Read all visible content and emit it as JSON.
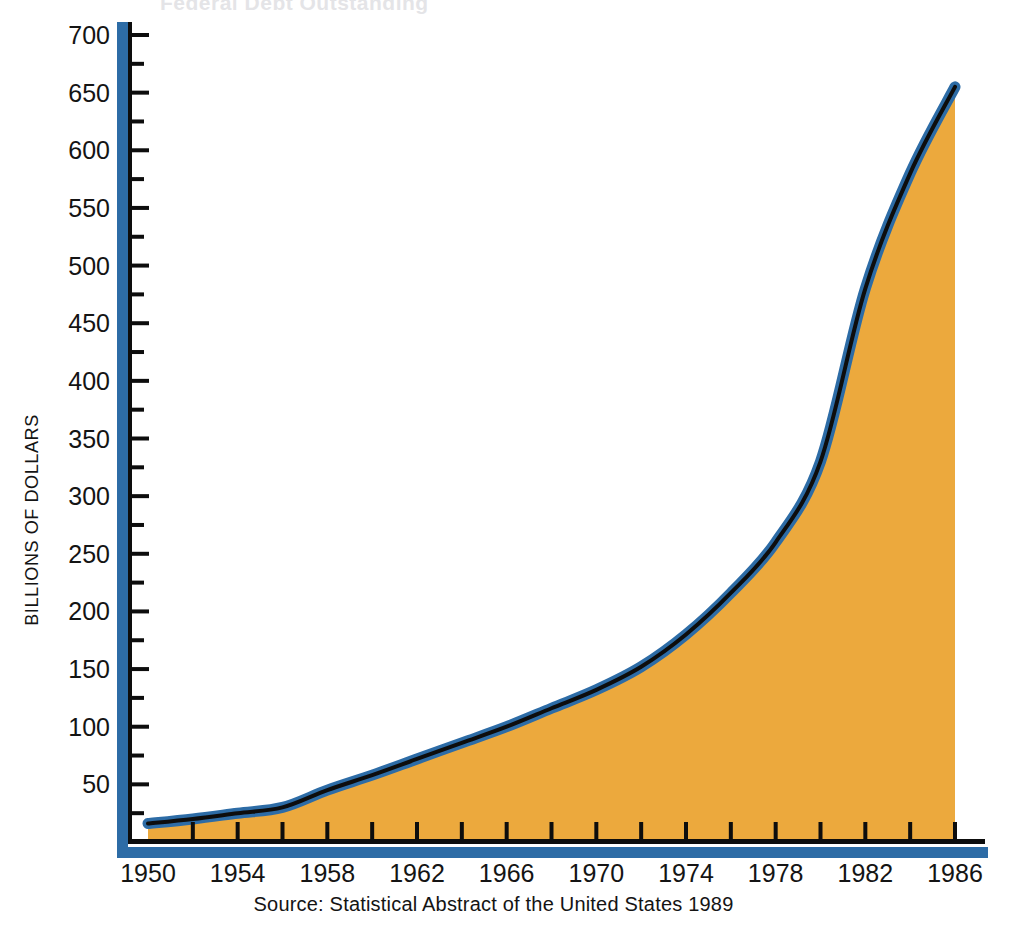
{
  "figure": {
    "ghost_title_fragment": "Federal Debt Outstanding",
    "source_note": "Source: Statistical Abstract of the United States 1989"
  },
  "axes": {
    "y_axis_title": "BILLIONS OF DOLLARS",
    "y_ticks": [
      "700",
      "650",
      "600",
      "550",
      "500",
      "450",
      "400",
      "350",
      "300",
      "250",
      "200",
      "150",
      "100",
      "50"
    ],
    "x_ticks": [
      "1950",
      "1954",
      "1958",
      "1962",
      "1966",
      "1970",
      "1974",
      "1978",
      "1982",
      "1986"
    ]
  },
  "colors": {
    "area_fill": "#eca93d",
    "band_blue": "#2d6ca6",
    "line_black": "#0d0d0d",
    "text": "#141414",
    "background": "#ffffff"
  },
  "chart_data": {
    "type": "area",
    "title": "",
    "subtitle": "",
    "xlabel": "",
    "ylabel": "BILLIONS OF DOLLARS",
    "xlim": [
      1950,
      1987
    ],
    "ylim": [
      0,
      700
    ],
    "ytick_values": [
      50,
      100,
      150,
      200,
      250,
      300,
      350,
      400,
      450,
      500,
      550,
      600,
      650,
      700
    ],
    "ytick_minor_step": 25,
    "xtick_values": [
      1950,
      1954,
      1958,
      1962,
      1966,
      1970,
      1974,
      1978,
      1982,
      1986
    ],
    "xtick_minor_step": 2,
    "grid": false,
    "legend": null,
    "series": [
      {
        "name": "Federal Debt Outstanding",
        "x": [
          1950,
          1952,
          1954,
          1956,
          1958,
          1960,
          1962,
          1964,
          1966,
          1968,
          1970,
          1972,
          1974,
          1976,
          1978,
          1980,
          1982,
          1984,
          1986
        ],
        "values": [
          16,
          20,
          25,
          30,
          45,
          58,
          72,
          86,
          100,
          116,
          132,
          152,
          180,
          216,
          260,
          330,
          480,
          580,
          655
        ]
      }
    ],
    "annotations": []
  }
}
